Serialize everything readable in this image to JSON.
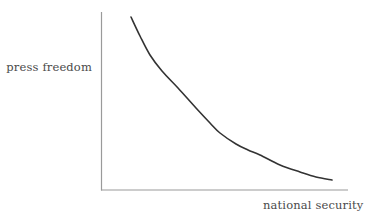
{
  "figure": {
    "background_color": "#ffffff",
    "width": 377,
    "height": 222
  },
  "chart_data": {
    "type": "line",
    "title": "",
    "subtitle": "",
    "xlabel": "national security",
    "ylabel": "press freedom",
    "grid": false,
    "legend": null,
    "axis": {
      "color": "#9a9a9a",
      "line_width": 1,
      "x_ticks": [],
      "y_ticks": [],
      "xlim": [
        0,
        1
      ],
      "ylim": [
        0,
        1
      ],
      "x_axis_pixels": {
        "x_start": 101,
        "x_end": 348,
        "y": 190
      },
      "y_axis_pixels": {
        "y_start": 12,
        "y_end": 190,
        "x": 101
      }
    },
    "series": [
      {
        "name": "tradeoff-curve",
        "color": "#333333",
        "line_width": 1.6,
        "description": "monotonically decreasing convex curve (exponential decay) showing inverse relationship",
        "points": [
          {
            "x": 131,
            "y": 17
          },
          {
            "x": 140,
            "y": 36
          },
          {
            "x": 150,
            "y": 55
          },
          {
            "x": 162,
            "y": 71
          },
          {
            "x": 178,
            "y": 88
          },
          {
            "x": 196,
            "y": 108
          },
          {
            "x": 210,
            "y": 123
          },
          {
            "x": 220,
            "y": 133
          },
          {
            "x": 236,
            "y": 144
          },
          {
            "x": 248,
            "y": 150
          },
          {
            "x": 260,
            "y": 155
          },
          {
            "x": 280,
            "y": 165
          },
          {
            "x": 300,
            "y": 172
          },
          {
            "x": 316,
            "y": 177
          },
          {
            "x": 332,
            "y": 180
          }
        ]
      }
    ],
    "annotations": []
  },
  "labels": {
    "y_axis": "press freedom",
    "x_axis": "national security"
  }
}
